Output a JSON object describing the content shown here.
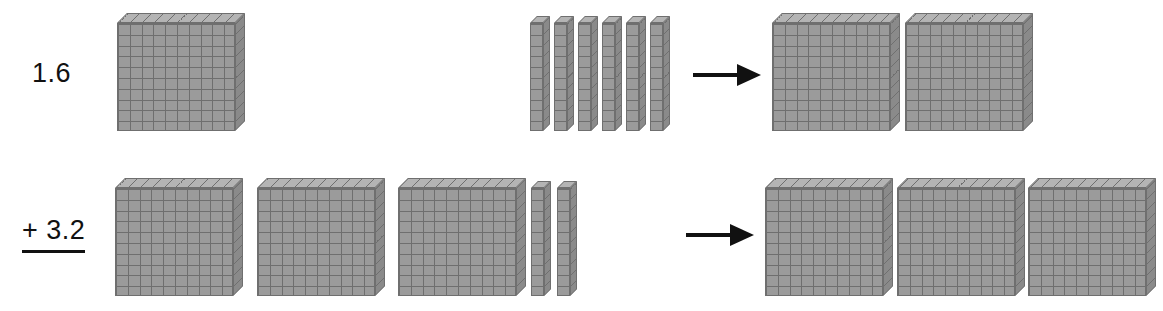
{
  "diagram": {
    "background_color": "#ffffff",
    "block_fill_color": "#9b9b9b",
    "block_line_color": "#6f6f6f",
    "block_top_face_color": "#b4b4b4",
    "block_side_face_color": "#8a8a8a",
    "text_color": "#111111",
    "arrow_color": "#111111"
  },
  "rows": [
    {
      "id": "addend-row",
      "label": "1.6",
      "label_underlined": false,
      "addend_value": 1.6,
      "flats": 1,
      "rods": 6,
      "arrow": "right-arrow",
      "result_flats": 2,
      "result_rods": 0
    },
    {
      "id": "second-addend-row",
      "label": "+ 3.2",
      "label_underlined": true,
      "addend_value": 3.2,
      "flats": 3,
      "rods": 2,
      "arrow": "right-arrow",
      "result_flats": 3,
      "result_rods": 0
    }
  ],
  "icons": {
    "arrow": "right-arrow-icon"
  },
  "layout": {
    "flat_cells_per_side": 10,
    "rod_cells": 10
  }
}
